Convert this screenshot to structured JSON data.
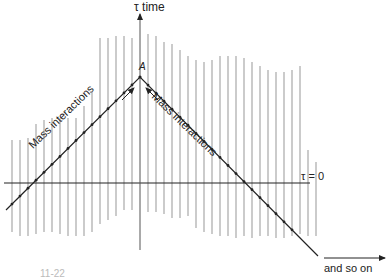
{
  "figure": {
    "axis_label": "τ time",
    "apex_label": "A",
    "tau_zero_label": "τ = 0",
    "left_path_label": "Mass interactions",
    "right_path_label": "Mass interactions",
    "continuation_label": "and so on",
    "caption_fragment": "11-22"
  },
  "colors": {
    "worldline": "#a8a8a8",
    "ink": "#222222"
  },
  "geometry": {
    "time_axis": {
      "x": 140,
      "y_top": 4,
      "y_bottom": 250
    },
    "tau_zero_line": {
      "y": 183,
      "x_start": 4,
      "x_end": 310
    },
    "apex": {
      "x": 140,
      "y": 77
    },
    "left_branch_end": {
      "x": 6,
      "y": 210
    },
    "right_branch_end": {
      "x": 318,
      "y": 256
    },
    "continuation_arrow": {
      "x_start": 324,
      "x_end": 385,
      "y": 258
    }
  },
  "worldlines": [
    {
      "x": 12,
      "top": 140,
      "bottom": 232
    },
    {
      "x": 20,
      "top": 140,
      "bottom": 236
    },
    {
      "x": 28,
      "top": 138,
      "bottom": 236
    },
    {
      "x": 36,
      "top": 124,
      "bottom": 234
    },
    {
      "x": 44,
      "top": 120,
      "bottom": 232
    },
    {
      "x": 52,
      "top": 118,
      "bottom": 232
    },
    {
      "x": 60,
      "top": 118,
      "bottom": 234
    },
    {
      "x": 68,
      "top": 118,
      "bottom": 236
    },
    {
      "x": 76,
      "top": 118,
      "bottom": 236
    },
    {
      "x": 84,
      "top": 106,
      "bottom": 236
    },
    {
      "x": 92,
      "top": 92,
      "bottom": 232
    },
    {
      "x": 100,
      "top": 38,
      "bottom": 224
    },
    {
      "x": 108,
      "top": 38,
      "bottom": 220
    },
    {
      "x": 116,
      "top": 36,
      "bottom": 216
    },
    {
      "x": 124,
      "top": 36,
      "bottom": 210
    },
    {
      "x": 132,
      "top": 38,
      "bottom": 210
    },
    {
      "x": 148,
      "top": 34,
      "bottom": 212
    },
    {
      "x": 156,
      "top": 36,
      "bottom": 212
    },
    {
      "x": 164,
      "top": 42,
      "bottom": 214
    },
    {
      "x": 172,
      "top": 44,
      "bottom": 218
    },
    {
      "x": 180,
      "top": 50,
      "bottom": 218
    },
    {
      "x": 188,
      "top": 56,
      "bottom": 216
    },
    {
      "x": 196,
      "top": 60,
      "bottom": 228
    },
    {
      "x": 204,
      "top": 62,
      "bottom": 232
    },
    {
      "x": 212,
      "top": 60,
      "bottom": 234
    },
    {
      "x": 220,
      "top": 56,
      "bottom": 236
    },
    {
      "x": 228,
      "top": 56,
      "bottom": 236
    },
    {
      "x": 236,
      "top": 56,
      "bottom": 238
    },
    {
      "x": 244,
      "top": 58,
      "bottom": 236
    },
    {
      "x": 252,
      "top": 62,
      "bottom": 238
    },
    {
      "x": 260,
      "top": 66,
      "bottom": 236
    },
    {
      "x": 268,
      "top": 70,
      "bottom": 236
    },
    {
      "x": 276,
      "top": 72,
      "bottom": 238
    },
    {
      "x": 284,
      "top": 72,
      "bottom": 238
    },
    {
      "x": 292,
      "top": 70,
      "bottom": 236
    },
    {
      "x": 300,
      "top": 66,
      "bottom": 234
    },
    {
      "x": 308,
      "top": 150,
      "bottom": 236
    },
    {
      "x": 316,
      "top": 162,
      "bottom": 236
    }
  ]
}
